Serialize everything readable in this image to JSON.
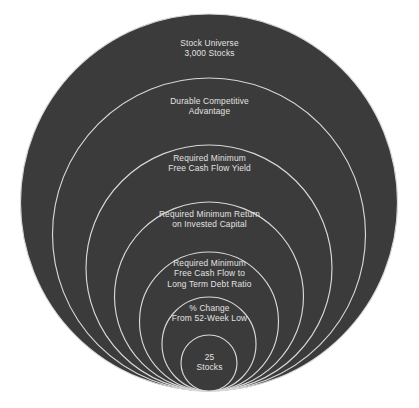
{
  "diagram": {
    "type": "nested-circles-funnel",
    "background_color": "#ffffff",
    "fill_color": "#3b3b3b",
    "stroke_color": "#d8d8d8",
    "text_color": "#e2e2e2",
    "tangent_point": {
      "x": 209,
      "y": 391
    },
    "rings": [
      {
        "id": "stock-universe",
        "label": "Stock Universe\n3,000 Stocks",
        "line1": "Stock Universe",
        "line2": "3,000 Stocks",
        "top_y": 14,
        "label_y": 38
      },
      {
        "id": "durable-competitive-advantage",
        "label": "Durable Competitive\nAdvantage",
        "line1": "Durable Competitive",
        "line2": "Advantage",
        "top_y": 78,
        "label_y": 96
      },
      {
        "id": "free-cash-flow-yield",
        "label": "Required Minimum\nFree Cash Flow Yield",
        "line1": "Required Minimum",
        "line2": "Free Cash Flow Yield",
        "top_y": 145,
        "label_y": 153
      },
      {
        "id": "return-on-invested-capital",
        "label": "Required Minimum Return\non Invested Capital",
        "line1": "Required Minimum Return",
        "line2": "on Invested Capital",
        "top_y": 202,
        "label_y": 209
      },
      {
        "id": "fcf-to-long-term-debt-ratio",
        "label": "Required Minimum\nFree Cash Flow to\nLong Term Debt Ratio",
        "line1": "Required Minimum",
        "line2": "Free Cash Flow to",
        "line3": "Long Term Debt Ratio",
        "top_y": 252,
        "label_y": 258
      },
      {
        "id": "percent-change-from-52-week-low",
        "label": "% Change\nFrom 52-Week Low",
        "line1": "% Change",
        "line2": "From 52-Week Low",
        "top_y": 297,
        "label_y": 303
      },
      {
        "id": "final-selection",
        "label": "25\nStocks",
        "line1": "25",
        "line2": "Stocks",
        "top_y": 335,
        "label_y": 352
      }
    ]
  }
}
